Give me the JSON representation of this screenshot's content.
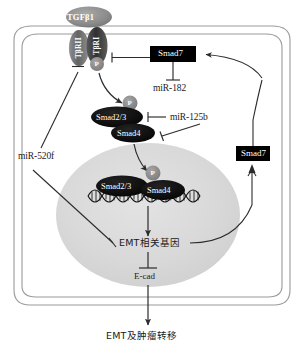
{
  "figure": {
    "type": "signaling-pathway-diagram"
  },
  "colors": {
    "membrane_line": "#8a8a8a",
    "nucleus_fill": "#d8d8d8",
    "oval_dark": "#0d0d0d",
    "receptor_gray": "#6e6e6e",
    "receptor_dark": "#3a3a3a",
    "phospho_gray": "#8c8c8c",
    "box_black": "#000000",
    "arrow": "#2b2b2b",
    "text": "#1a1a1a"
  },
  "ligand": {
    "label": "TGFβ1"
  },
  "receptors": {
    "type2_label": "TβRII",
    "type1_label": "TβRI",
    "phospho_label": "P"
  },
  "cytoplasm": {
    "smad23": {
      "label": "Smad2/3",
      "phospho_label": "P"
    },
    "smad4": {
      "label": "Smad4"
    },
    "smad7_box": {
      "label": "Smad7"
    },
    "mir182": {
      "label": "miR-182"
    },
    "mir125b": {
      "label": "miR-125b"
    },
    "mir520f": {
      "label": "miR-520f"
    },
    "smad7_feedback_box": {
      "label": "Smad7"
    }
  },
  "nucleus": {
    "smad23": {
      "label": "Smad2/3",
      "phospho_label": "P"
    },
    "smad4": {
      "label": "Smad4"
    },
    "dna_label": "DNA double helix",
    "target_gene": {
      "label": "EMT相关基因"
    },
    "ecad": {
      "label": "E-cad"
    }
  },
  "outcome": {
    "label": "EMT及肿瘤转移"
  },
  "interactions": [
    {
      "source": "TGFβ1",
      "target": "TβRII/TβRI",
      "type": "binding"
    },
    {
      "source": "TβRI-P",
      "target": "Smad2/3",
      "type": "activation"
    },
    {
      "source": "Smad7",
      "target": "TβRI-P",
      "type": "inhibition"
    },
    {
      "source": "miR-182",
      "target": "Smad7",
      "type": "inhibition"
    },
    {
      "source": "miR-125b",
      "target": "Smad2/3",
      "type": "inhibition"
    },
    {
      "source": "miR-125b",
      "target": "Smad4",
      "type": "inhibition"
    },
    {
      "source": "miR-520f",
      "target": "EMT相关基因",
      "type": "inhibition"
    },
    {
      "source": "Smad2/3-Smad4",
      "target": "nucleus",
      "type": "translocation"
    },
    {
      "source": "EMT相关基因",
      "target": "E-cad",
      "type": "inhibition"
    },
    {
      "source": "E-cad",
      "target": "EMT及肿瘤转移",
      "type": "activation"
    },
    {
      "source": "EMT相关基因",
      "target": "Smad7",
      "type": "activation-feedback"
    }
  ]
}
